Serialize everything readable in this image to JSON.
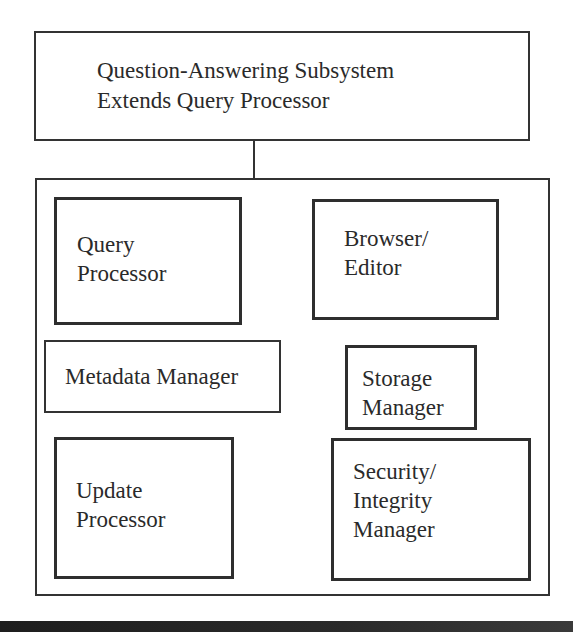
{
  "diagram": {
    "top_box": {
      "line1": "Question-Answering Subsystem",
      "line2": "Extends Query Processor"
    },
    "container": {
      "components": [
        {
          "id": "query-processor",
          "label": "Query\nProcessor"
        },
        {
          "id": "browser-editor",
          "label": "Browser/\nEditor"
        },
        {
          "id": "metadata-manager",
          "label": "Metadata Manager"
        },
        {
          "id": "storage-manager",
          "label": "Storage\nManager"
        },
        {
          "id": "update-processor",
          "label": "Update\nProcessor"
        },
        {
          "id": "security-integrity-manager",
          "label": "Security/\nIntegrity\nManager"
        }
      ]
    },
    "connection": {
      "from": "top_box",
      "to": "container"
    }
  }
}
